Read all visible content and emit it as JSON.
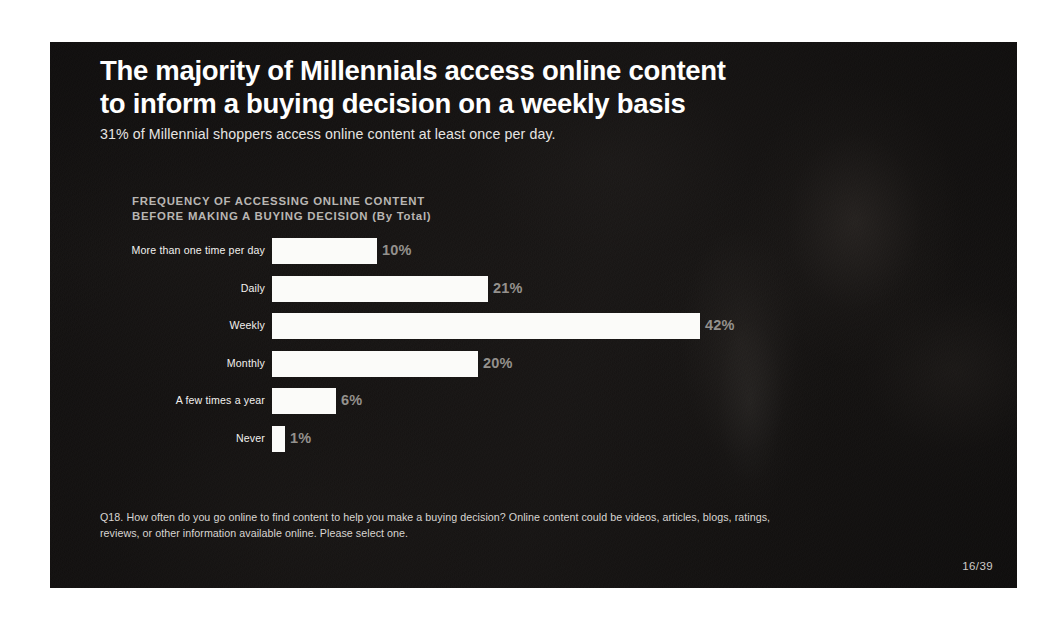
{
  "slide": {
    "headline_line_1": "The majority of Millennials access online content",
    "headline_line_2": "to inform a buying decision on a weekly basis",
    "subtitle": "31% of Millennial shoppers access online content at least once per day.",
    "page_number": "16/39",
    "footnote_line_1": "Q18. How often do you go online to find content to help you make a buying decision? Online content could be videos, articles, blogs, ratings,",
    "footnote_line_2": "reviews, or other information available online. Please select one."
  },
  "colors": {
    "bar_fill": "#fbfbf9",
    "headline_text": "#ffffff",
    "value_label": "#94918d",
    "category_label": "#f2f0ee",
    "chart_title": "#b9b6b3",
    "slide_background": "#231f20"
  },
  "chart_data": {
    "type": "bar",
    "orientation": "horizontal",
    "title_line_1": "FREQUENCY OF ACCESSING ONLINE CONTENT",
    "title_line_2": "BEFORE MAKING A BUYING DECISION (By Total)",
    "title": "FREQUENCY OF ACCESSING ONLINE CONTENT BEFORE MAKING A BUYING DECISION (By Total)",
    "xlabel": "",
    "ylabel": "",
    "grid": false,
    "legend": false,
    "axis_visible": false,
    "value_suffix": "%",
    "categories": [
      "More than one time per day",
      "Daily",
      "Weekly",
      "Monthly",
      "A few times a year",
      "Never"
    ],
    "values": [
      10,
      21,
      42,
      20,
      6,
      1
    ],
    "labels": [
      "10%",
      "21%",
      "42%",
      "20%",
      "6%",
      "1%"
    ],
    "bar_pixel_widths": [
      105,
      216,
      428,
      206,
      64,
      13
    ],
    "xlim": [
      0,
      42
    ]
  }
}
